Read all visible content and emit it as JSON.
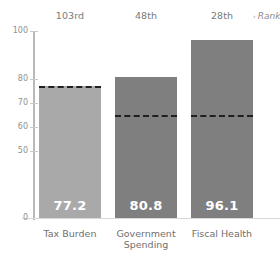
{
  "chart_data": {
    "type": "bar",
    "title": "",
    "xlabel": "",
    "ylabel": "",
    "ylim": [
      0,
      100
    ],
    "grid": false,
    "categories": [
      "Tax Burden",
      "Government Spending",
      "Fiscal Health"
    ],
    "values": [
      77.2,
      80.8,
      96.1
    ],
    "value_labels": [
      "77.2",
      "80.8",
      "96.1"
    ],
    "ranks": [
      "103rd",
      "48th",
      "28th"
    ],
    "rank_note": "Rank",
    "rank_note_bullet": "‹",
    "reference_lines": {
      "label": "",
      "style": "dashed",
      "color": "#1f1f1f",
      "values": [
        77.2,
        65.0,
        65.0
      ]
    },
    "y_ticks": [
      {
        "label": "100",
        "value": 100
      },
      {
        "label": "80",
        "value": 80
      },
      {
        "label": "70",
        "value": 70
      },
      {
        "label": "60",
        "value": 60
      },
      {
        "label": "50",
        "value": 50
      },
      {
        "label": "0",
        "value": 0
      }
    ],
    "bar_colors": [
      "#a9a9a9",
      "#7f7f7f",
      "#7f7f7f"
    ],
    "axis_color": "#b9b9b9",
    "background": "#ffffff"
  }
}
